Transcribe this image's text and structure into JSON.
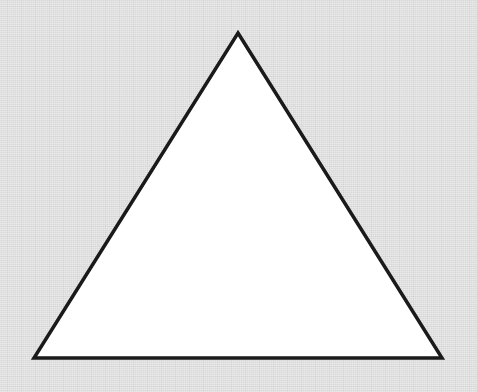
{
  "figure": {
    "canvas": {
      "width": 477,
      "height": 392,
      "background_color": "#d9d9d9",
      "texture": "scanned-paper-dither"
    },
    "shapes": [
      {
        "name": "triangle",
        "kind": "polygon",
        "sides": 3,
        "classification": "isosceles",
        "orientation": "apex-up",
        "fill_color": "#ffffff",
        "stroke_color": "#1a1a1a",
        "stroke_width": 3.5,
        "stroke_linejoin": "miter",
        "vertices": [
          {
            "label": "apex",
            "x": 238,
            "y": 33
          },
          {
            "label": "bottom-right",
            "x": 442,
            "y": 358
          },
          {
            "label": "bottom-left",
            "x": 34,
            "y": 358
          }
        ],
        "points_attr": "238,33 442,358 34,358",
        "base_width": 408,
        "height": 325
      }
    ],
    "labels": [],
    "annotations": []
  }
}
